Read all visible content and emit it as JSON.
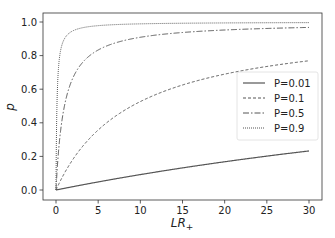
{
  "chart_data": {
    "type": "line",
    "title": "",
    "xlabel": "LR+",
    "ylabel": "p",
    "xlim": [
      -1.5,
      31.5
    ],
    "ylim": [
      -0.05,
      1.05
    ],
    "xticks": [
      0,
      5,
      10,
      15,
      20,
      25,
      30
    ],
    "yticks": [
      0.0,
      0.2,
      0.4,
      0.6,
      0.8,
      1.0
    ],
    "xtick_labels": [
      "0",
      "5",
      "10",
      "15",
      "20",
      "25",
      "30"
    ],
    "ytick_labels": [
      "0.0",
      "0.2",
      "0.4",
      "0.6",
      "0.8",
      "1.0"
    ],
    "grid": false,
    "legend_position": "center right",
    "formula": "p = P*LR / (P*LR + 1 - P)",
    "x": [
      0,
      0.5,
      1,
      2,
      3,
      5,
      7.5,
      10,
      15,
      20,
      25,
      30
    ],
    "series": [
      {
        "name": "P=0.01",
        "P": 0.01,
        "style": "solid",
        "values": [
          0.0,
          0.005,
          0.01,
          0.02,
          0.029,
          0.048,
          0.071,
          0.092,
          0.132,
          0.168,
          0.202,
          0.233
        ]
      },
      {
        "name": "P=0.1",
        "P": 0.1,
        "style": "dashed",
        "values": [
          0.0,
          0.053,
          0.1,
          0.182,
          0.25,
          0.357,
          0.455,
          0.526,
          0.625,
          0.69,
          0.735,
          0.769
        ]
      },
      {
        "name": "P=0.5",
        "P": 0.5,
        "style": "dashdot",
        "values": [
          0.0,
          0.333,
          0.5,
          0.667,
          0.75,
          0.833,
          0.882,
          0.909,
          0.938,
          0.952,
          0.962,
          0.968
        ]
      },
      {
        "name": "P=0.9",
        "P": 0.9,
        "style": "dotted",
        "values": [
          0.0,
          0.818,
          0.9,
          0.947,
          0.964,
          0.978,
          0.985,
          0.989,
          0.993,
          0.994,
          0.996,
          0.996
        ]
      }
    ]
  },
  "legend": {
    "items": [
      {
        "label": "P=0.01"
      },
      {
        "label": "P=0.1"
      },
      {
        "label": "P=0.5"
      },
      {
        "label": "P=0.9"
      }
    ]
  },
  "axes": {
    "xlabel_main": "LR",
    "xlabel_sub": "+",
    "ylabel": "p"
  },
  "colors": {
    "line": "#555555",
    "frame": "#333333",
    "legend_border": "#cccccc"
  }
}
